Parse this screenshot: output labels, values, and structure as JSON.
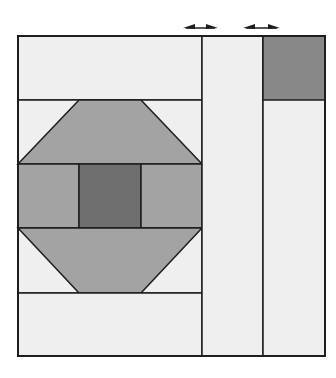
{
  "diagram": {
    "title": "",
    "colors": {
      "light": "#efefef",
      "medium": "#a3a3a3",
      "dark": "#6f6f6f",
      "corner": "#888888",
      "line": "#1e1e1e",
      "background": "#ffffff"
    },
    "arrows": [
      {
        "name": "sashing-width-arrow-1",
        "x1": 183,
        "x2": 218,
        "y": 28
      },
      {
        "name": "sashing-width-arrow-2",
        "x1": 243,
        "x2": 280,
        "y": 28
      }
    ]
  }
}
